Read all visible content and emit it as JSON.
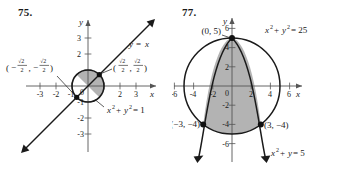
{
  "panels": [
    {
      "number": "75.",
      "axes": {
        "x_label": "x",
        "y_label": "y",
        "x_ticks": [
          "-3",
          "-2",
          "-1",
          "1",
          "2",
          "3"
        ],
        "y_ticks": [
          "3",
          "2",
          "1",
          "-1",
          "-2",
          "-3"
        ],
        "origin_label": "0",
        "x_range": [
          -3.9,
          3.9
        ],
        "y_range": [
          -3.6,
          3.6
        ]
      },
      "curves": [
        {
          "name": "unit-circle",
          "equation": "x^2 + y^2 = 1",
          "type": "circle",
          "center": [
            0,
            0
          ],
          "radius": 1
        },
        {
          "name": "line-y-equals-x",
          "equation": "y = x",
          "type": "line",
          "slope": 1,
          "intercept": 0
        }
      ],
      "curve_labels": [
        {
          "name": "line-label",
          "text_parts": {
            "lhs": "y",
            "eq": "=",
            "rhs": "x"
          }
        },
        {
          "name": "circle-label",
          "text_parts": {
            "x": "x",
            "xsup": "2",
            "plus": "+",
            "y": "y",
            "ysup": "2",
            "eq": "= 1"
          }
        }
      ],
      "points": [
        {
          "name": "intersection-upper-right",
          "x": 0.7071,
          "y": 0.7071,
          "label": {
            "open": "(",
            "num1": "√2",
            "den1": "2",
            "comma": ",",
            "num2": "√2",
            "den2": "2",
            "close": ")",
            "sign1": "",
            "sign2": ""
          }
        },
        {
          "name": "intersection-lower-left",
          "x": -0.7071,
          "y": -0.7071,
          "label": {
            "open": "(",
            "num1": "√2",
            "den1": "2",
            "comma": ",",
            "num2": "√2",
            "den2": "2",
            "close": ")",
            "sign1": "−",
            "sign2": "−"
          }
        }
      ],
      "shaded_region": {
        "name": "upper-left-half-disk",
        "description": "region inside unit circle above the line y = x",
        "fill": "#b3b3b3"
      }
    },
    {
      "number": "77.",
      "axes": {
        "x_label": "x",
        "y_label": "y",
        "x_ticks": [
          "-6",
          "-4",
          "-2",
          "2",
          "4",
          "6"
        ],
        "y_ticks": [
          "6",
          "4",
          "2",
          "-2",
          "-4",
          "-6"
        ],
        "origin_label": "0",
        "x_range": [
          -7.4,
          7.4
        ],
        "y_range": [
          -7.2,
          7.2
        ]
      },
      "curves": [
        {
          "name": "circle-radius-5",
          "equation": "x^2 + y^2 = 25",
          "type": "circle",
          "center": [
            0,
            0
          ],
          "radius": 5
        },
        {
          "name": "downward-parabola",
          "equation": "x^2 + y = 5",
          "type": "parabola",
          "vertex": [
            0,
            5
          ]
        }
      ],
      "curve_labels": [
        {
          "name": "circle-label",
          "text_parts": {
            "x": "x",
            "xsup": "2",
            "plus": "+",
            "y": "y",
            "ysup": "2",
            "eq": "= 25"
          }
        },
        {
          "name": "parabola-label",
          "text_parts": {
            "x": "x",
            "xsup": "2",
            "plus": "+",
            "y": "y",
            "ysup": "",
            "eq": "= 5"
          }
        }
      ],
      "points": [
        {
          "name": "vertex-point",
          "x": 0,
          "y": 5,
          "label": "(0, 5)"
        },
        {
          "name": "intersection-left",
          "x": -3,
          "y": -4,
          "label": "(−3, −4)"
        },
        {
          "name": "intersection-right",
          "x": 3,
          "y": -4,
          "label": "(3, −4)"
        }
      ],
      "shaded_region": {
        "name": "region-inside-circle-below-parabola",
        "description": "region inside circle and below/inside the parabola",
        "fill": "#b3b3b3"
      }
    }
  ],
  "colors": {
    "ink": "#1a1a1a",
    "shade": "#b3b3b3",
    "axis": "#555555",
    "page_bg": "#ffffff"
  }
}
